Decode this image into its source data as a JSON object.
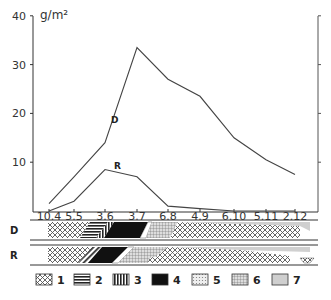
{
  "chart_data": {
    "type": "line",
    "title": "",
    "ylabel": "g/m²",
    "xlabel": "",
    "ylim": [
      0,
      40
    ],
    "yticks": [
      10,
      20,
      30,
      40
    ],
    "ytick_labels": [
      "10",
      "20",
      "30",
      "40"
    ],
    "grid": false,
    "categories": [
      "10.4",
      "5.5",
      "3.6",
      "3.7",
      "6.8",
      "4.9",
      "6.10",
      "5.11",
      "2.12"
    ],
    "series": [
      {
        "name": "D",
        "values": [
          1.5,
          7,
          14,
          33.5,
          27,
          23.5,
          15,
          10.5,
          7.5
        ]
      },
      {
        "name": "R",
        "values": [
          0,
          2,
          8.5,
          7,
          1,
          0.5,
          0,
          0,
          0
        ]
      }
    ],
    "bands": [
      {
        "label": "D"
      },
      {
        "label": "R"
      }
    ],
    "legend": [
      {
        "id": "1",
        "label": "1",
        "pattern": "crosshatch"
      },
      {
        "id": "2",
        "label": "2",
        "pattern": "horizontal-lines"
      },
      {
        "id": "3",
        "label": "3",
        "pattern": "vertical-lines"
      },
      {
        "id": "4",
        "label": "4",
        "pattern": "solid-black"
      },
      {
        "id": "5",
        "label": "5",
        "pattern": "fine-dots"
      },
      {
        "id": "6",
        "label": "6",
        "pattern": "grid"
      },
      {
        "id": "7",
        "label": "7",
        "pattern": "light-gray"
      }
    ],
    "legend_position": "bottom"
  }
}
